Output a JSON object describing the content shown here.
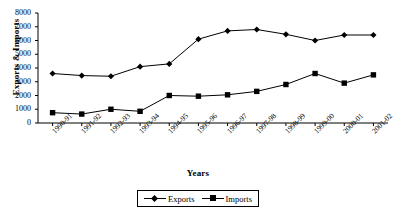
{
  "chart_data": {
    "type": "line",
    "title": "",
    "xlabel": "Years",
    "ylabel": "Exports & Imports",
    "categories": [
      "1990-91",
      "1991-92",
      "1992-93",
      "1993-94",
      "1994-95",
      "1995-96",
      "1996-97",
      "1997-98",
      "1998-99",
      "1999-00",
      "2000-01",
      "2001-02"
    ],
    "series": [
      {
        "name": "Exports",
        "marker": "diamond",
        "values": [
          3600,
          3450,
          3400,
          4100,
          4300,
          6100,
          6700,
          6800,
          6450,
          6000,
          6400,
          6400
        ]
      },
      {
        "name": "Imports",
        "marker": "square",
        "values": [
          750,
          650,
          1000,
          850,
          2000,
          1950,
          2050,
          2300,
          2800,
          3600,
          2900,
          3500
        ]
      }
    ],
    "ylim": [
      0,
      8000
    ],
    "yticks": [
      0,
      1000,
      2000,
      3000,
      4000,
      5000,
      6000,
      7000,
      8000
    ],
    "ytick_labels": [
      "0",
      "1000",
      "2000",
      "3000",
      "4000",
      "5000",
      "6000",
      "7000",
      "8000"
    ],
    "grid": false,
    "legend_position": "bottom",
    "line_color": "#000000",
    "marker_color": "#000000",
    "background_color": "#ffffff"
  },
  "legend": {
    "entries": [
      {
        "label": "Exports"
      },
      {
        "label": "Imports"
      }
    ]
  }
}
